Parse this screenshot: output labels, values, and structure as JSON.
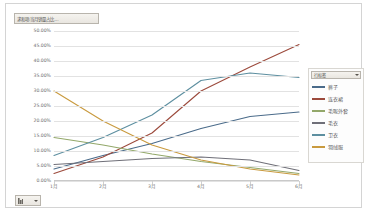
{
  "pivot": {
    "filter_button_top_label": "求和项:当月销量占比...",
    "filter_button_bottom_label": "月",
    "legend_field_label": "行标签"
  },
  "chart_data": {
    "type": "line",
    "title": "",
    "xlabel": "",
    "ylabel": "",
    "categories": [
      "1月",
      "2月",
      "3月",
      "4月",
      "5月",
      "6月"
    ],
    "ylim": [
      0,
      50
    ],
    "ytick_labels": [
      "0.00%",
      "5.00%",
      "10.00%",
      "15.00%",
      "20.00%",
      "25.00%",
      "30.00%",
      "35.00%",
      "40.00%",
      "45.00%",
      "50.00%"
    ],
    "ytick_values": [
      0,
      5,
      10,
      15,
      20,
      25,
      30,
      35,
      40,
      45,
      50
    ],
    "grid": true,
    "legend_position": "right",
    "series": [
      {
        "name": "裤子",
        "color": "#4a6b8a",
        "values": [
          4.0,
          8.5,
          12.5,
          17.5,
          21.5,
          23.0
        ]
      },
      {
        "name": "连衣裙",
        "color": "#9c4a3c",
        "values": [
          2.5,
          8.0,
          16.0,
          30.0,
          38.0,
          45.5
        ]
      },
      {
        "name": "毛呢外套",
        "color": "#93a86a",
        "values": [
          14.5,
          12.0,
          9.0,
          6.5,
          4.5,
          2.5
        ]
      },
      {
        "name": "毛衣",
        "color": "#6f6f78",
        "values": [
          5.5,
          6.5,
          7.5,
          8.0,
          7.0,
          3.5
        ]
      },
      {
        "name": "卫衣",
        "color": "#5d8fa0",
        "values": [
          8.5,
          14.5,
          22.0,
          33.5,
          36.0,
          34.5
        ]
      },
      {
        "name": "羽绒服",
        "color": "#c99a3e",
        "values": [
          30.0,
          20.0,
          12.0,
          7.0,
          4.0,
          2.0
        ]
      }
    ]
  }
}
